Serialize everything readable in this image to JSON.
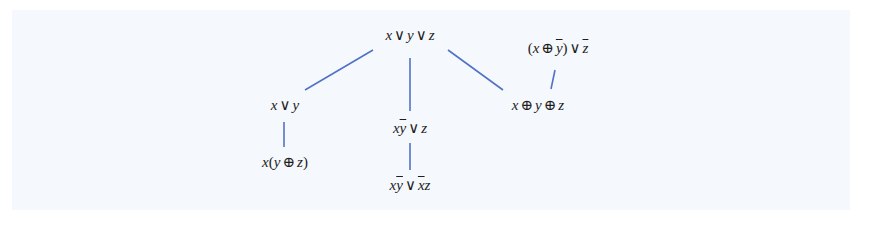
{
  "diagram": {
    "background": "#f5f8fc",
    "edge_color": "#5272c6",
    "text_color": "#1e1e1e",
    "nodes": [
      {
        "id": "root",
        "label": "x ∨ y ∨ z",
        "x": 410,
        "y": 26
      },
      {
        "id": "xory",
        "label": "x ∨ y",
        "x": 285,
        "y": 96
      },
      {
        "id": "xybar_or_z",
        "label": "xȳ ∨ z",
        "x": 410,
        "y": 119
      },
      {
        "id": "xxor",
        "label": "x ⊕ y ⊕ z",
        "x": 538,
        "y": 96
      },
      {
        "id": "xxorybar_or_zbar",
        "label": "(x ⊕ ȳ) ∨ z̄",
        "x": 558,
        "y": 39
      },
      {
        "id": "x_yxorz",
        "label": "x(y ⊕ z)",
        "x": 285,
        "y": 153
      },
      {
        "id": "xybar_or_xbarz",
        "label": "xȳ ∨ x̄z",
        "x": 410,
        "y": 176
      }
    ],
    "edges": [
      {
        "from": "root",
        "to": "xory",
        "x1": 373,
        "y1": 50,
        "x2": 305,
        "y2": 90
      },
      {
        "from": "root",
        "to": "xybar_or_z",
        "x1": 410,
        "y1": 58,
        "x2": 410,
        "y2": 111
      },
      {
        "from": "root",
        "to": "xxor",
        "x1": 448,
        "y1": 50,
        "x2": 503,
        "y2": 90
      },
      {
        "from": "xxorybar_or_zbar",
        "to": "xxor",
        "x1": 555,
        "y1": 70,
        "x2": 551,
        "y2": 89
      },
      {
        "from": "xory",
        "to": "x_yxorz",
        "x1": 284,
        "y1": 122,
        "x2": 284,
        "y2": 147
      },
      {
        "from": "xybar_or_z",
        "to": "xybar_or_xbarz",
        "x1": 410,
        "y1": 143,
        "x2": 410,
        "y2": 170
      }
    ]
  }
}
